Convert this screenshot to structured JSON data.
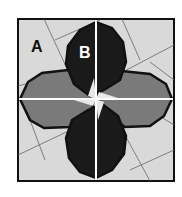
{
  "diagram": {
    "type": "quilt-block",
    "labels": {
      "a": "A",
      "b": "B"
    },
    "colors": {
      "background": "#d9d9d9",
      "petal_dark": "#1a1a1a",
      "petal_gray": "#7a7a7a",
      "outline": "#111111",
      "seam": "#ffffff",
      "guide_line": "#666666"
    }
  }
}
